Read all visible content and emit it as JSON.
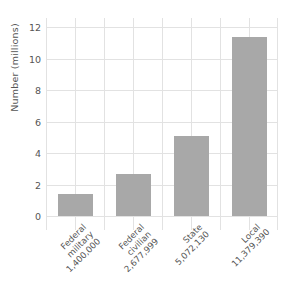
{
  "chart_data": {
    "type": "bar",
    "title": "",
    "xlabel": "",
    "ylabel": "Number (millions)",
    "ylim": [
      0,
      12.6
    ],
    "yticks": [
      0,
      2,
      4,
      6,
      8,
      10,
      12
    ],
    "ytick_labels": [
      "0",
      "2",
      "4",
      "6",
      "8",
      "10",
      "12"
    ],
    "grid": "both",
    "legend": "none",
    "bar_color": "#a8a8a8",
    "grid_color": "#e2e2e2",
    "text_color": "#555555",
    "categories": [
      "Federal\nmilitary\n1,400,000",
      "Federal\ncivilian\n2,677,999",
      "State\n5,072,130",
      "Local\n11,379,390"
    ],
    "values": [
      1.4,
      2.677999,
      5.07213,
      11.37939
    ],
    "bars": [
      {
        "name": "Federal military",
        "line1": "Federal",
        "line2": "military",
        "line3": "1,400,000",
        "value": 1.4,
        "raw_value": "1,400,000"
      },
      {
        "name": "Federal civilian",
        "line1": "Federal",
        "line2": "civilian",
        "line3": "2,677,999",
        "value": 2.677999,
        "raw_value": "2,677,999"
      },
      {
        "name": "State",
        "line1": "State",
        "line2": "5,072,130",
        "line3": "",
        "value": 5.07213,
        "raw_value": "5,072,130"
      },
      {
        "name": "Local",
        "line1": "Local",
        "line2": "11,379,390",
        "line3": "",
        "value": 11.37939,
        "raw_value": "11,379,390"
      }
    ]
  }
}
